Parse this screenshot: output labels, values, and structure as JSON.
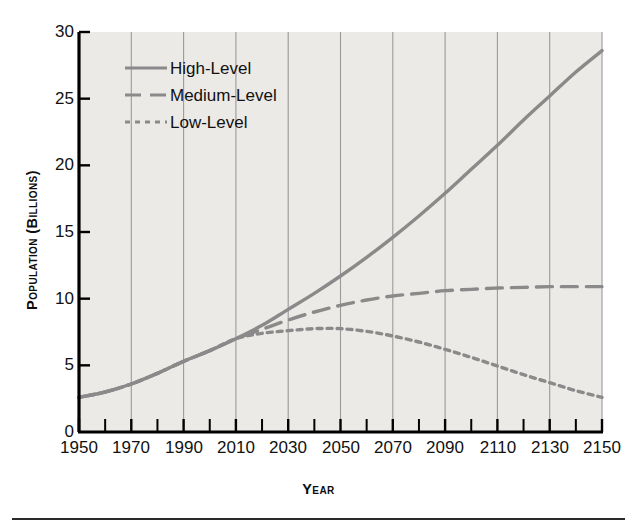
{
  "chart_data": {
    "type": "line",
    "title": "",
    "xlabel": "Year",
    "ylabel": "Population (Billions)",
    "xlim": [
      1950,
      2150
    ],
    "ylim": [
      0,
      30
    ],
    "xticks": [
      1950,
      1970,
      1990,
      2010,
      2030,
      2050,
      2070,
      2090,
      2110,
      2130,
      2150
    ],
    "xtick_labels": [
      "1950",
      "1970",
      "1990",
      "2010",
      "2030",
      "2050",
      "2070",
      "2090",
      "2110",
      "2130",
      "2150"
    ],
    "yticks": [
      0,
      5,
      10,
      15,
      20,
      25,
      30
    ],
    "ytick_labels": [
      "0",
      "5",
      "10",
      "15",
      "20",
      "25",
      "30"
    ],
    "x_minor_tick_interval": 10,
    "grid": "vertical-major-only",
    "legend_position": "upper-left-inside",
    "background_color": "#eceae7",
    "line_color": "#8a8a8a",
    "axis_color": "#000000",
    "grid_color": "#9a9a9a",
    "x": [
      1950,
      1960,
      1970,
      1980,
      1990,
      2000,
      2010,
      2020,
      2030,
      2040,
      2050,
      2060,
      2070,
      2080,
      2090,
      2100,
      2110,
      2120,
      2130,
      2140,
      2150
    ],
    "series": [
      {
        "name": "High-Level",
        "style": "solid",
        "values": [
          2.6,
          3.0,
          3.6,
          4.4,
          5.3,
          6.1,
          7.0,
          8.0,
          9.2,
          10.4,
          11.7,
          13.1,
          14.6,
          16.2,
          17.9,
          19.7,
          21.5,
          23.4,
          25.2,
          27.0,
          28.6
        ]
      },
      {
        "name": "Medium-Level",
        "style": "dashed",
        "values": [
          2.6,
          3.0,
          3.6,
          4.4,
          5.3,
          6.1,
          7.0,
          7.7,
          8.4,
          9.0,
          9.5,
          9.9,
          10.2,
          10.4,
          10.6,
          10.7,
          10.8,
          10.85,
          10.9,
          10.9,
          10.9
        ]
      },
      {
        "name": "Low-Level",
        "style": "dotted",
        "values": [
          2.6,
          3.0,
          3.6,
          4.4,
          5.3,
          6.1,
          7.0,
          7.4,
          7.6,
          7.75,
          7.75,
          7.55,
          7.2,
          6.75,
          6.2,
          5.6,
          4.95,
          4.3,
          3.7,
          3.1,
          2.6
        ]
      }
    ],
    "legend": [
      {
        "label": "High-Level",
        "style": "solid"
      },
      {
        "label": "Medium-Level",
        "style": "dashed"
      },
      {
        "label": "Low-Level",
        "style": "dotted"
      }
    ]
  }
}
